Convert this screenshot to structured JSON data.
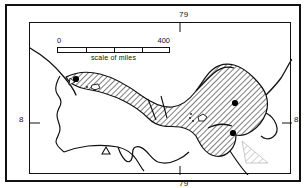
{
  "figure": {
    "type": "map",
    "frame_color": "#111111",
    "background_color": "#ffffff"
  },
  "graticule": {
    "longitude_top_label": "79",
    "longitude_bottom_label": "79",
    "latitude_left_label": "8",
    "latitude_right_label": "8",
    "corner_bottom_left_label": "8",
    "corner_bottom_right_label": "8"
  },
  "scale_bar": {
    "min_label": "0",
    "max_label": "400",
    "caption": "scale of miles",
    "divisions": 4,
    "units": "miles"
  },
  "symbols": {
    "city_dot_color": "#000000",
    "hatch_color": "#111111",
    "hatch_fill_label": "distribution range (hatched)",
    "light_hatch_label": "secondary range (light hatch)",
    "triangle_label": "triangle locality symbol"
  }
}
